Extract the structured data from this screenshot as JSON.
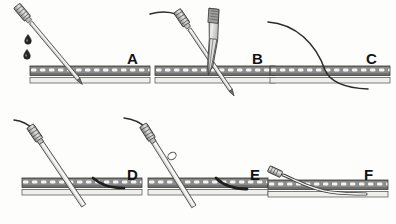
{
  "figure": {
    "style": "grayscale medical line illustration",
    "background_color": "#fdfdfc",
    "ink_color": "#2b2b2b",
    "rows": 2,
    "columns": 3,
    "label_color": "#121212"
  },
  "tissue": {
    "name": "vessel-wall-and-lumen",
    "wall_fill": "#8f8f8f",
    "wall_stipple": "#ffffff",
    "lumen_fill": "#efefec",
    "outline": "#3a3a3a"
  },
  "instruments": {
    "needle_shaft_fill": "#d8d8d6",
    "needle_hub_fill": "#a9a9a7",
    "hub_outline": "#333333",
    "guidewire_color": "#2e2e2e",
    "catheter_fill": "#e8e8e6",
    "blood_drop_fill": "#2a2a2a",
    "forceps_fill": "#cfcfcd"
  },
  "panels": [
    {
      "id": "A",
      "label": "A",
      "step": 1,
      "caption": "Needle punctures the vessel; blood flashback confirms entry",
      "elements": [
        "introducer-needle",
        "needle-hub",
        "blood-drops",
        "vessel-wall",
        "vessel-lumen"
      ],
      "blood_drop_count": 2
    },
    {
      "id": "B",
      "label": "B",
      "step": 2,
      "caption": "Guidewire advanced through the needle, held with forceps",
      "elements": [
        "introducer-needle",
        "needle-hub",
        "guidewire",
        "forceps",
        "vessel-wall",
        "vessel-lumen"
      ]
    },
    {
      "id": "C",
      "label": "C",
      "step": 3,
      "caption": "Needle withdrawn leaving the guidewire in the vessel",
      "elements": [
        "guidewire",
        "vessel-wall",
        "vessel-lumen"
      ]
    },
    {
      "id": "D",
      "label": "D",
      "step": 4,
      "caption": "Dilator and catheter advanced over the guidewire",
      "elements": [
        "catheter",
        "catheter-hub",
        "guidewire",
        "vessel-wall",
        "vessel-lumen"
      ]
    },
    {
      "id": "E",
      "label": "E",
      "step": 5,
      "caption": "Catheter seated in the vessel, guidewire being removed",
      "elements": [
        "catheter",
        "catheter-hub",
        "guidewire",
        "catheter-ring",
        "vessel-wall",
        "vessel-lumen"
      ]
    },
    {
      "id": "F",
      "label": "F",
      "step": 6,
      "caption": "Catheter left in place and laid flat against the skin",
      "elements": [
        "catheter",
        "catheter-hub",
        "vessel-wall",
        "vessel-lumen"
      ]
    }
  ],
  "labels": {
    "a": "A",
    "b": "B",
    "c": "C",
    "d": "D",
    "e": "E",
    "f": "F"
  }
}
